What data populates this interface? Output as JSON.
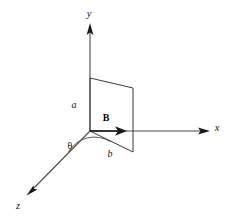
{
  "figure": {
    "background_color": "#ffffff",
    "line_color": "#4b4b4b",
    "accent_color": "#1a1a1a",
    "width": 237,
    "height": 219
  },
  "axes": {
    "origin": {
      "x": 90,
      "y": 131
    },
    "y_axis": {
      "label": "y",
      "label_x": 89,
      "label_y": 17,
      "from": {
        "x": 90,
        "y": 131
      },
      "to": {
        "x": 90,
        "y": 23
      },
      "direction": "up"
    },
    "x_axis": {
      "label": "x",
      "label_x": 217,
      "label_y": 131,
      "from": {
        "x": 90,
        "y": 131
      },
      "to": {
        "x": 208,
        "y": 131
      },
      "direction": "right"
    },
    "z_axis": {
      "label": "z",
      "label_x": 18,
      "label_y": 209,
      "from": {
        "x": 90,
        "y": 131
      },
      "to": {
        "x": 27,
        "y": 195
      },
      "direction": "down-left"
    }
  },
  "loop": {
    "name": "rectangular-current-loop",
    "vertices": [
      {
        "x": 90,
        "y": 78
      },
      {
        "x": 133,
        "y": 88
      },
      {
        "x": 133,
        "y": 152
      },
      {
        "x": 90,
        "y": 131
      }
    ],
    "side_a": {
      "label": "a",
      "label_x": 74,
      "label_y": 108,
      "description": "vertical side along y-axis"
    },
    "side_b": {
      "label": "b",
      "label_x": 110,
      "label_y": 156,
      "description": "tilted side in the xz-plane"
    }
  },
  "field_vector": {
    "label": "B",
    "label_x": 106,
    "label_y": 121,
    "from": {
      "x": 90,
      "y": 131
    },
    "to": {
      "x": 126,
      "y": 131
    },
    "direction": "along +x"
  },
  "angle": {
    "label": "θ",
    "label_x": 70,
    "label_y": 148,
    "arc_radius": 30,
    "between": [
      "z-axis",
      "loop bottom edge b"
    ]
  }
}
